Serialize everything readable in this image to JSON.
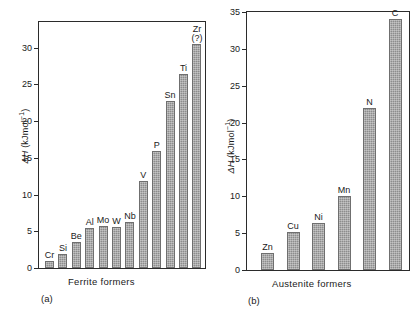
{
  "figure": {
    "width": 412,
    "height": 310,
    "bar_color": "#8d8d8d",
    "axis_color": "#2b2b2b",
    "background": "#ffffff"
  },
  "panels": [
    {
      "tag": "(a)",
      "caption": "Ferrite formers",
      "chart_data": {
        "type": "bar",
        "title": "",
        "xlabel": "Ferrite formers",
        "ylabel": "ΔH (kJmol⁻¹)",
        "ylim": [
          0,
          33.5
        ],
        "yticks": [
          0,
          5,
          10,
          15,
          20,
          25,
          30
        ],
        "ytick_labels": [
          "0",
          "5",
          "10",
          "15",
          "20",
          "25",
          "30"
        ],
        "grid": false,
        "legend": "none",
        "categories": [
          "Cr",
          "Si",
          "Be",
          "Al",
          "Mo",
          "W",
          "Nb",
          "V",
          "P",
          "Sn",
          "Ti",
          "Zr (?)"
        ],
        "values": [
          0.9,
          1.9,
          3.5,
          5.4,
          5.7,
          5.6,
          6.3,
          11.9,
          15.9,
          22.8,
          26.4,
          30.5
        ]
      }
    },
    {
      "tag": "(b)",
      "caption": "Austenite  formers",
      "chart_data": {
        "type": "bar",
        "title": "",
        "xlabel": "Austenite formers",
        "ylabel": "ΔH (kJmol⁻¹)",
        "ylim": [
          0,
          35
        ],
        "yticks": [
          0,
          5,
          10,
          15,
          20,
          25,
          30,
          35
        ],
        "ytick_labels": [
          "0",
          "5",
          "10",
          "15",
          "20",
          "25",
          "30",
          "35"
        ],
        "grid": false,
        "legend": "none",
        "categories": [
          "Zn",
          "Cu",
          "Ni",
          "Mn",
          "N",
          "C"
        ],
        "values": [
          2.3,
          5.2,
          6.4,
          10.0,
          22.0,
          34.0
        ]
      }
    }
  ],
  "axis_title": {
    "delta": "Δ",
    "h": "H",
    "units": " (kJmol",
    "exponent": "−1",
    "close": ")"
  }
}
